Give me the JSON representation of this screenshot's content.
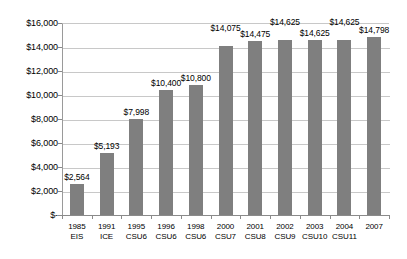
{
  "chart_data": {
    "type": "bar",
    "title": "",
    "subtitle": "",
    "xlabel": "",
    "ylabel": "",
    "ylim": [
      0,
      16000
    ],
    "grid": true,
    "legend": "none",
    "orientation": "vertical",
    "bar_color": "#7f7f7f",
    "categories": [
      "1985 EIS",
      "1991 ICE",
      "1995 CSU6",
      "1996 CSU6",
      "1998 CSU6",
      "2000 CSU7",
      "2001 CSU8",
      "2002 CSU9",
      "2003 CSU10",
      "2004 CSU11",
      "2007"
    ],
    "category_lines": [
      {
        "year": "1985",
        "code": "EIS"
      },
      {
        "year": "1991",
        "code": "ICE"
      },
      {
        "year": "1995",
        "code": "CSU6"
      },
      {
        "year": "1996",
        "code": "CSU6"
      },
      {
        "year": "1998",
        "code": "CSU6"
      },
      {
        "year": "2000",
        "code": "CSU7"
      },
      {
        "year": "2001",
        "code": "CSU8"
      },
      {
        "year": "2002",
        "code": "CSU9"
      },
      {
        "year": "2003",
        "code": "CSU10"
      },
      {
        "year": "2004",
        "code": "CSU11"
      },
      {
        "year": "2007",
        "code": ""
      }
    ],
    "values": [
      2564,
      5193,
      7998,
      10400,
      10800,
      14075,
      14475,
      14625,
      14625,
      14625,
      14798
    ],
    "data_labels": [
      "$2,564",
      "$5,193",
      "$7,998",
      "$10,400",
      "$10,800",
      "$14,075",
      "$14,475",
      "$14,625",
      "$14,625",
      "$14,625",
      "$14,798"
    ],
    "label_placement": [
      "above",
      "above",
      "above",
      "above",
      "above",
      "high",
      "above",
      "high",
      "above",
      "high",
      "above"
    ],
    "ytick_labels": [
      "$16,000",
      "$14,000",
      "$12,000",
      "$10,000",
      "$8,000",
      "$6,000",
      "$4,000",
      "$2,000",
      "$-"
    ],
    "ytick_values": [
      16000,
      14000,
      12000,
      10000,
      8000,
      6000,
      4000,
      2000,
      0
    ]
  }
}
